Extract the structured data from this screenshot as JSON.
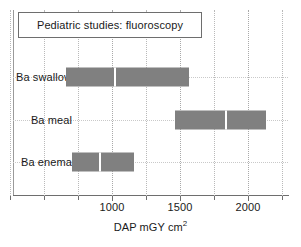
{
  "chart_data": {
    "type": "bar",
    "orientation": "horizontal",
    "title": "Pediatric studies: fluoroscopy",
    "xlabel": "DAP mGY cm",
    "xlabel_superscript": "2",
    "ylabel": "",
    "xlim": [
      0,
      2500
    ],
    "grid": true,
    "legend": false,
    "categories": [
      "Ba swallow",
      "Ba meal",
      "Ba enema"
    ],
    "bars": [
      {
        "category": "Ba swallow",
        "start": 665,
        "end": 1565,
        "divider": 1015,
        "color": "#808080"
      },
      {
        "category": "Ba meal",
        "start": 1460,
        "end": 2135,
        "divider": 1830,
        "color": "#808080"
      },
      {
        "category": "Ba enema",
        "start": 705,
        "end": 1165,
        "divider": 905,
        "color": "#808080"
      }
    ],
    "xticks_major": [
      1000,
      1500,
      2000
    ],
    "xticklabels": [
      "1000",
      "1500",
      "2000"
    ],
    "xticks_minor": [
      250,
      500,
      750,
      1250,
      1750,
      2250
    ],
    "gridline_values": [
      250,
      500,
      750,
      1000,
      1250,
      1500,
      1750,
      2000,
      2250
    ],
    "colors": {
      "bar": "#808080",
      "grid": "#b9b9b9",
      "axis": "#6e6e6e",
      "text": "#1a1a1a",
      "background": "#ffffff",
      "divider": "#ffffff"
    }
  }
}
